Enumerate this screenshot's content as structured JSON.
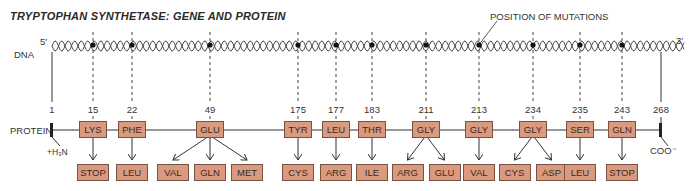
{
  "title": "TRYPTOPHAN SYNTHETASE: GENE AND PROTEIN",
  "labels": {
    "dna": "DNA",
    "protein": "PROTEIN",
    "five_prime": "5′",
    "three_prime": "3′",
    "n_terminus": "+H₃N",
    "c_terminus": "COO⁻",
    "mutation_callout": "POSITION OF MUTATIONS"
  },
  "ends": {
    "start": "1",
    "end": "268"
  },
  "mutations": [
    {
      "pos": "15",
      "x": 93,
      "wild": "LYS",
      "mutants": [
        "STOP"
      ]
    },
    {
      "pos": "22",
      "x": 132,
      "wild": "PHE",
      "mutants": [
        "LEU"
      ]
    },
    {
      "pos": "49",
      "x": 210,
      "wild": "GLU",
      "mutants": [
        "VAL",
        "GLN",
        "MET"
      ]
    },
    {
      "pos": "175",
      "x": 298,
      "wild": "TYR",
      "mutants": [
        "CYS"
      ]
    },
    {
      "pos": "177",
      "x": 336,
      "wild": "LEU",
      "mutants": [
        "ARG"
      ]
    },
    {
      "pos": "183",
      "x": 372,
      "wild": "THR",
      "mutants": [
        "ILE"
      ]
    },
    {
      "pos": "211",
      "x": 426,
      "wild": "GLY",
      "mutants": [
        "ARG",
        "GLU"
      ]
    },
    {
      "pos": "213",
      "x": 479,
      "wild": "GLY",
      "mutants": [
        "VAL"
      ]
    },
    {
      "pos": "234",
      "x": 533,
      "wild": "GLY",
      "mutants": [
        "CYS",
        "ASP"
      ]
    },
    {
      "pos": "235",
      "x": 580,
      "wild": "SER",
      "mutants": [
        "LEU"
      ]
    },
    {
      "pos": "243",
      "x": 622,
      "wild": "GLN",
      "mutants": [
        "STOP"
      ]
    }
  ],
  "colors": {
    "box_fill": "#d99a7f",
    "box_border": "#7a5040",
    "line": "#333333"
  }
}
